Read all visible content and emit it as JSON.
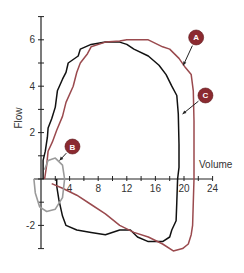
{
  "chart_data": {
    "type": "line",
    "title": "",
    "xlabel": "Volume",
    "ylabel": "Flow",
    "xlim": [
      0,
      24
    ],
    "ylim": [
      -3,
      7
    ],
    "x_ticks": [
      "4",
      "8",
      "12",
      "16",
      "20",
      "24"
    ],
    "y_ticks": [
      "-2",
      "2",
      "4",
      "6"
    ],
    "grid": false,
    "legend": "none",
    "colors": {
      "black": "#111111",
      "red": "#9a4a4e",
      "gray": "#9a9a9a",
      "badge": "#8b2a30",
      "axis": "#222222"
    },
    "series": [
      {
        "name": "black loop",
        "color": "#111111",
        "points": [
          [
            0.3,
            0
          ],
          [
            0.3,
            0.8
          ],
          [
            0.6,
            1.2
          ],
          [
            0.9,
            1.8
          ],
          [
            1,
            2.2
          ],
          [
            1.5,
            2.6
          ],
          [
            2,
            3.1
          ],
          [
            2.3,
            3.8
          ],
          [
            3,
            4.3
          ],
          [
            3.5,
            4.6
          ],
          [
            3.8,
            5.0
          ],
          [
            5.2,
            5.3
          ],
          [
            5.5,
            5.6
          ],
          [
            7,
            5.8
          ],
          [
            9,
            5.9
          ],
          [
            11,
            5.9
          ],
          [
            12,
            5.8
          ],
          [
            13,
            5.6
          ],
          [
            15,
            5.3
          ],
          [
            16.5,
            4.9
          ],
          [
            17.5,
            4.5
          ],
          [
            18.3,
            4.0
          ],
          [
            19,
            3.6
          ],
          [
            19.2,
            2.8
          ],
          [
            19.3,
            1.5
          ],
          [
            19.3,
            0.5
          ],
          [
            19.1,
            0
          ],
          [
            19,
            -1
          ],
          [
            18.9,
            -1.8
          ],
          [
            18.3,
            -2.2
          ],
          [
            18,
            -2.5
          ],
          [
            17,
            -2.7
          ],
          [
            15,
            -2.7
          ],
          [
            13.5,
            -2.5
          ],
          [
            12.5,
            -2.2
          ],
          [
            11,
            -2.2
          ],
          [
            9,
            -2.4
          ],
          [
            7,
            -2.3
          ],
          [
            5,
            -2.2
          ],
          [
            3.5,
            -2.0
          ],
          [
            3,
            -1.6
          ],
          [
            2.5,
            -0.9
          ],
          [
            2.2,
            -0.3
          ],
          [
            2.2,
            0
          ]
        ]
      },
      {
        "name": "red loop",
        "color": "#9a4a4e",
        "points": [
          [
            0.5,
            0
          ],
          [
            0.8,
            0.6
          ],
          [
            1,
            1.2
          ],
          [
            1.6,
            1.6
          ],
          [
            2.2,
            2.1
          ],
          [
            3,
            2.7
          ],
          [
            3.5,
            3.3
          ],
          [
            4.5,
            4.0
          ],
          [
            5,
            4.6
          ],
          [
            5.5,
            5.0
          ],
          [
            6.5,
            5.4
          ],
          [
            7,
            5.7
          ],
          [
            9,
            5.9
          ],
          [
            11,
            5.95
          ],
          [
            12,
            6.0
          ],
          [
            15,
            6.0
          ],
          [
            17,
            5.7
          ],
          [
            18,
            5.6
          ],
          [
            19.3,
            5.2
          ],
          [
            20.2,
            4.8
          ],
          [
            21,
            4.5
          ],
          [
            21.3,
            3.8
          ],
          [
            21.4,
            2.5
          ],
          [
            21.4,
            1.0
          ],
          [
            21.4,
            0
          ],
          [
            21.3,
            -1.0
          ],
          [
            21.2,
            -2.0
          ],
          [
            21,
            -2.4
          ],
          [
            20.6,
            -2.8
          ],
          [
            19.8,
            -3.0
          ],
          [
            18.5,
            -3.1
          ],
          [
            17,
            -2.8
          ],
          [
            15,
            -2.5
          ],
          [
            13,
            -2.3
          ],
          [
            11,
            -2.0
          ],
          [
            9,
            -1.5
          ],
          [
            7,
            -1.1
          ],
          [
            5,
            -0.7
          ],
          [
            3,
            -0.4
          ],
          [
            1.5,
            -0.2
          ]
        ]
      },
      {
        "name": "gray loop",
        "color": "#9a9a9a",
        "points": [
          [
            0.5,
            0.4
          ],
          [
            1,
            0.8
          ],
          [
            2,
            0.9
          ],
          [
            3,
            0.6
          ],
          [
            3.3,
            0
          ],
          [
            3,
            -0.8
          ],
          [
            2,
            -1.3
          ],
          [
            0.8,
            -1.4
          ],
          [
            -0.2,
            -1.2
          ],
          [
            -0.8,
            -0.6
          ],
          [
            -1,
            0
          ]
        ]
      }
    ],
    "annotations": [
      {
        "label": "A",
        "badge_xy": [
          21.7,
          6.1
        ],
        "arrow_to": [
          19.9,
          4.9
        ]
      },
      {
        "label": "B",
        "badge_xy": [
          4.4,
          1.4
        ],
        "arrow_to": [
          2.6,
          0.8
        ]
      },
      {
        "label": "C",
        "badge_xy": [
          23.0,
          3.6
        ],
        "arrow_to": [
          19.8,
          2.8
        ]
      }
    ]
  }
}
